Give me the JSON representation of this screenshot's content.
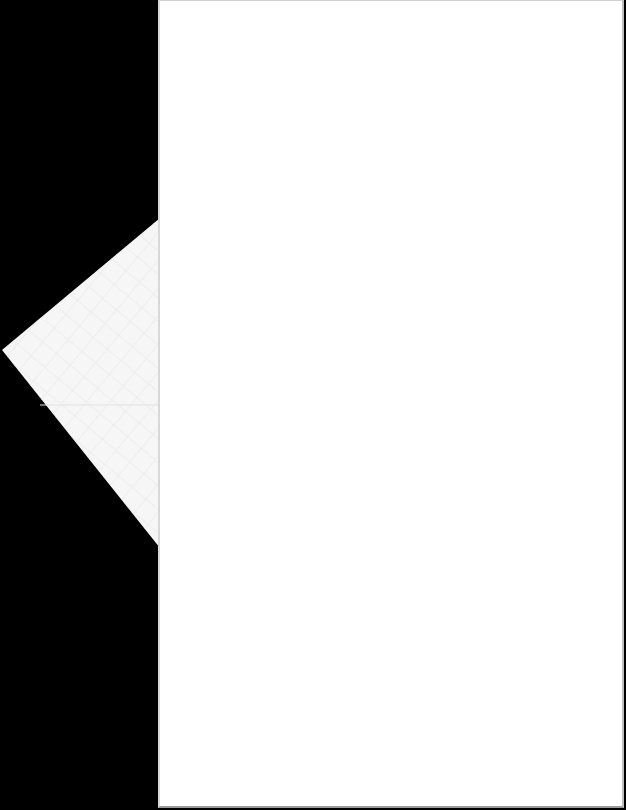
{
  "document": {
    "type": "scanned-page",
    "content": "",
    "background_color": "#000000",
    "page_color": "#ffffff",
    "folded_corner_color": "#f4f4f4"
  }
}
